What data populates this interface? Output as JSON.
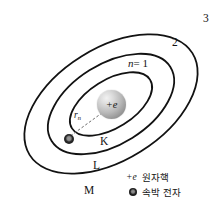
{
  "figure": {
    "type": "bohr-atomic-model",
    "background_color": "#ffffff",
    "line_color": "#121212"
  },
  "orbits": [
    {
      "id": "K",
      "quantum_number_label": "n = 1",
      "shell_label": "K",
      "rx": 46,
      "ry": 24,
      "rotation_deg": -32
    },
    {
      "id": "L",
      "quantum_number_label": "2",
      "shell_label": "L",
      "rx": 70,
      "ry": 40,
      "rotation_deg": -32
    },
    {
      "id": "M",
      "quantum_number_label": "3",
      "shell_label": "M",
      "rx": 96,
      "ry": 56,
      "rotation_deg": -32
    }
  ],
  "labels": {
    "n_equals": "n",
    "n_equals_value": "= 1",
    "orbit_2": "2",
    "orbit_3": "3",
    "shell_K": "K",
    "shell_L": "L",
    "shell_M": "M",
    "radius": "r",
    "radius_subscript": "n"
  },
  "nucleus": {
    "charge_label": "+e",
    "center_x": 111,
    "center_y": 104,
    "diameter": 29,
    "color": "#b8b8b8"
  },
  "electron": {
    "center_x": 69,
    "center_y": 139,
    "diameter": 10,
    "color": "#141414"
  },
  "legend": {
    "items": [
      {
        "key_text": "+e",
        "key_icon": "none",
        "label": "원자핵"
      },
      {
        "key_text": "",
        "key_icon": "electron-dot-icon",
        "label": "속박 전자"
      }
    ]
  }
}
